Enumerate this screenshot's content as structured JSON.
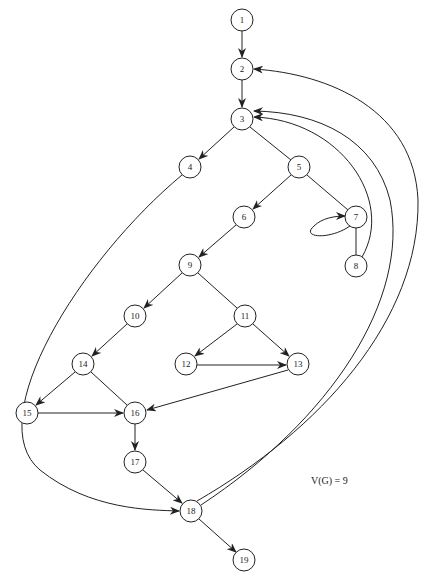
{
  "diagram": {
    "type": "control-flow-graph",
    "nodes": [
      {
        "id": "1",
        "x": 242,
        "y": 20
      },
      {
        "id": "2",
        "x": 242,
        "y": 69
      },
      {
        "id": "3",
        "x": 242,
        "y": 119
      },
      {
        "id": "4",
        "x": 190,
        "y": 167
      },
      {
        "id": "5",
        "x": 299,
        "y": 167
      },
      {
        "id": "6",
        "x": 244,
        "y": 217
      },
      {
        "id": "7",
        "x": 356,
        "y": 217
      },
      {
        "id": "8",
        "x": 356,
        "y": 266
      },
      {
        "id": "9",
        "x": 190,
        "y": 265
      },
      {
        "id": "10",
        "x": 135,
        "y": 316
      },
      {
        "id": "11",
        "x": 245,
        "y": 316
      },
      {
        "id": "12",
        "x": 186,
        "y": 364
      },
      {
        "id": "13",
        "x": 298,
        "y": 364
      },
      {
        "id": "14",
        "x": 83,
        "y": 364
      },
      {
        "id": "15",
        "x": 27,
        "y": 413
      },
      {
        "id": "16",
        "x": 135,
        "y": 413
      },
      {
        "id": "17",
        "x": 135,
        "y": 462
      },
      {
        "id": "18",
        "x": 191,
        "y": 511
      },
      {
        "id": "19",
        "x": 244,
        "y": 560
      }
    ],
    "edges": [
      {
        "from": "1",
        "to": "2",
        "arrow": true
      },
      {
        "from": "2",
        "to": "3",
        "arrow": true
      },
      {
        "from": "3",
        "to": "4",
        "arrow": true
      },
      {
        "from": "3",
        "to": "5",
        "arrow": false
      },
      {
        "from": "5",
        "to": "6",
        "arrow": true
      },
      {
        "from": "5",
        "to": "7",
        "arrow": false
      },
      {
        "from": "7",
        "to": "7",
        "arrow": true,
        "self_loop": true
      },
      {
        "from": "7",
        "to": "8",
        "arrow": false
      },
      {
        "from": "8",
        "to": "3",
        "arrow": true,
        "curved": true
      },
      {
        "from": "7",
        "to": "3",
        "arrow": true,
        "curved": true
      },
      {
        "from": "6",
        "to": "9",
        "arrow": true
      },
      {
        "from": "9",
        "to": "10",
        "arrow": true
      },
      {
        "from": "9",
        "to": "11",
        "arrow": false
      },
      {
        "from": "11",
        "to": "12",
        "arrow": true
      },
      {
        "from": "11",
        "to": "13",
        "arrow": true
      },
      {
        "from": "12",
        "to": "13",
        "arrow": true
      },
      {
        "from": "13",
        "to": "16",
        "arrow": true
      },
      {
        "from": "10",
        "to": "14",
        "arrow": true
      },
      {
        "from": "14",
        "to": "15",
        "arrow": true
      },
      {
        "from": "14",
        "to": "16",
        "arrow": false
      },
      {
        "from": "15",
        "to": "16",
        "arrow": true
      },
      {
        "from": "16",
        "to": "17",
        "arrow": true
      },
      {
        "from": "17",
        "to": "18",
        "arrow": true
      },
      {
        "from": "4",
        "to": "18",
        "arrow": true,
        "curved": true
      },
      {
        "from": "18",
        "to": "19",
        "arrow": true
      },
      {
        "from": "18",
        "to": "2",
        "arrow": true,
        "curved": true
      },
      {
        "from": "18",
        "to": "3",
        "arrow": true,
        "curved": true
      }
    ],
    "annotation": "V(G) = 9"
  }
}
